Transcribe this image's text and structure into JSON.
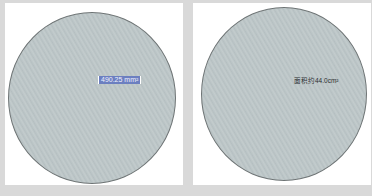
{
  "panels": [
    {
      "shape": "circle",
      "fill_color": "#bcc5c7",
      "label": "490.25 mm²",
      "label_selected": true,
      "label_highlight_color": "#6c7fc0"
    },
    {
      "shape": "circle",
      "fill_color": "#bcc5c7",
      "label": "面积约44.0cm²",
      "label_selected": false
    }
  ]
}
